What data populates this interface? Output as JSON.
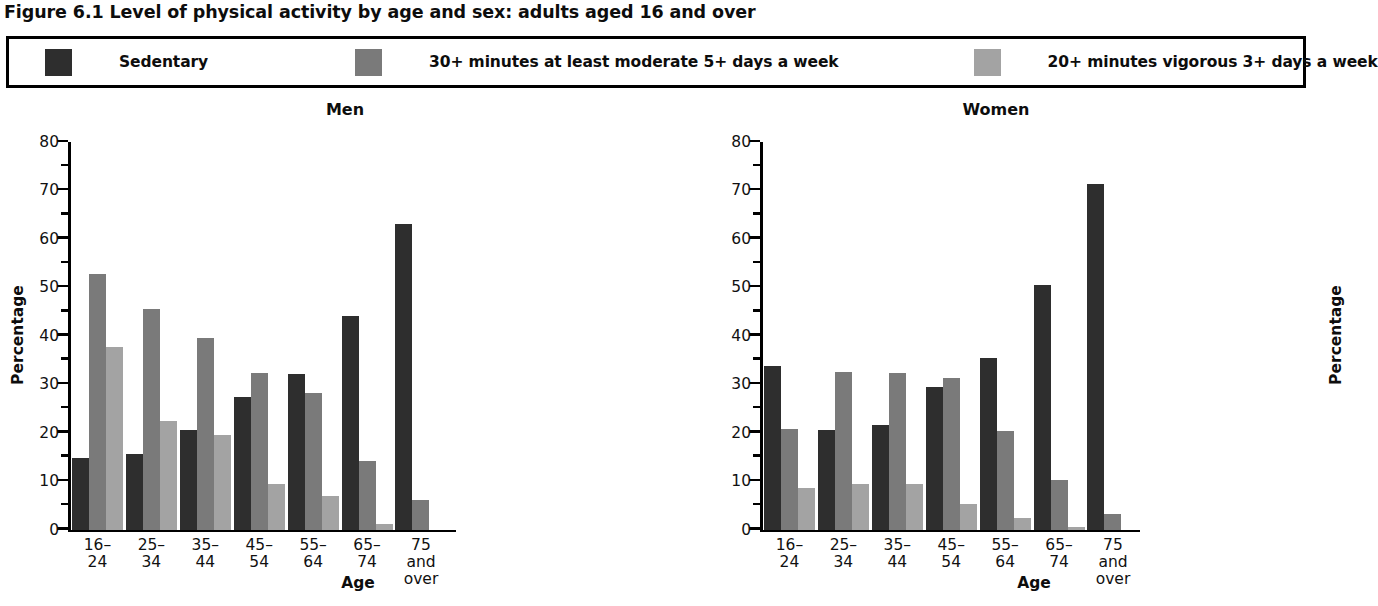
{
  "figure": {
    "title": "Figure 6.1 Level of physical activity by age and sex: adults aged 16 and over"
  },
  "legend": {
    "position": "top",
    "items": [
      {
        "label": "Sedentary",
        "color": "#2e2e2e"
      },
      {
        "label": "30+ minutes at least moderate 5+ days a week",
        "color": "#7a7a7a"
      },
      {
        "label": "20+ minutes vigorous 3+ days a week",
        "color": "#a3a3a3"
      }
    ]
  },
  "axis": {
    "tick_labels": [
      "80",
      "70",
      "60",
      "50",
      "40",
      "30",
      "20",
      "10",
      "0"
    ],
    "ylabel": "Percentage",
    "xlabel": "Age"
  },
  "chart_data": [
    {
      "type": "bar",
      "title": "Men",
      "categories": [
        "16–24",
        "25–34",
        "35–44",
        "45–54",
        "55–64",
        "65–74",
        "75 and\nover"
      ],
      "series": [
        {
          "name": "Sedentary",
          "color": "#2e2e2e",
          "values": [
            14.8,
            15.6,
            20.5,
            27.3,
            32.2,
            44.1,
            63.1
          ]
        },
        {
          "name": "30+ minutes at least moderate 5+ days a week",
          "color": "#7a7a7a",
          "values": [
            52.8,
            45.6,
            39.5,
            32.3,
            28.2,
            14.2,
            6.0
          ]
        },
        {
          "name": "20+ minutes vigorous 3+ days a week",
          "color": "#a3a3a3",
          "values": [
            37.7,
            22.4,
            19.5,
            9.3,
            7.0,
            1.2,
            0.0
          ]
        }
      ],
      "xlabel": "Age",
      "ylabel": "Percentage",
      "ylim": [
        0,
        80
      ],
      "ytick_step": 10,
      "yminor_step": 5,
      "grid": false,
      "legend_position": "top"
    },
    {
      "type": "bar",
      "title": "Women",
      "categories": [
        "16–24",
        "25–34",
        "35–44",
        "45–54",
        "55–64",
        "65–74",
        "75 and\nover"
      ],
      "series": [
        {
          "name": "Sedentary",
          "color": "#2e2e2e",
          "values": [
            33.7,
            20.6,
            21.5,
            29.4,
            35.4,
            50.4,
            71.4
          ]
        },
        {
          "name": "30+ minutes at least moderate 5+ days a week",
          "color": "#7a7a7a",
          "values": [
            20.7,
            32.5,
            32.4,
            31.3,
            20.4,
            10.2,
            3.2
          ]
        },
        {
          "name": "20+ minutes vigorous 3+ days a week",
          "color": "#a3a3a3",
          "values": [
            8.6,
            9.4,
            9.4,
            5.3,
            2.3,
            0.5,
            0.0
          ]
        }
      ],
      "xlabel": "Age",
      "ylabel": "Percentage",
      "ylim": [
        0,
        80
      ],
      "ytick_step": 10,
      "yminor_step": 5,
      "grid": false,
      "legend_position": "top"
    }
  ]
}
